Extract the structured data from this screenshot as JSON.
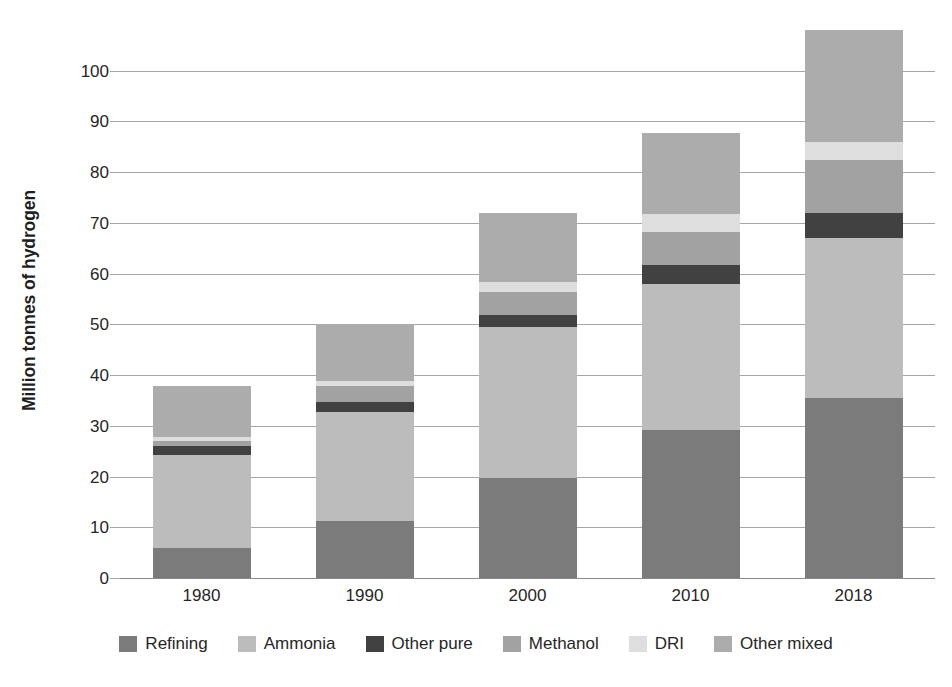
{
  "chart_data": {
    "type": "bar",
    "stacked": true,
    "title": "",
    "subtitle": "",
    "xlabel": "",
    "ylabel": "Million tonnes of hydrogen",
    "categories": [
      "1980",
      "1990",
      "2000",
      "2010",
      "2018"
    ],
    "ylim": [
      0,
      110
    ],
    "yticks": [
      0,
      10,
      20,
      30,
      40,
      50,
      60,
      70,
      80,
      90,
      100
    ],
    "ytick_labels": [
      "0",
      "10",
      "20",
      "30",
      "40",
      "50",
      "60",
      "70",
      "80",
      "90",
      "100"
    ],
    "grid": true,
    "legend_position": "bottom",
    "series": [
      {
        "name": "Refining",
        "color": "#7b7b7b",
        "values": [
          6.0,
          11.3,
          19.8,
          29.2,
          35.5
        ]
      },
      {
        "name": "Ammonia",
        "color": "#bcbcbc",
        "values": [
          18.3,
          21.5,
          29.7,
          28.8,
          31.5
        ]
      },
      {
        "name": "Other pure",
        "color": "#414141",
        "values": [
          1.7,
          1.9,
          2.3,
          3.8,
          5.0
        ]
      },
      {
        "name": "Methanol",
        "color": "#a2a2a2",
        "values": [
          1.0,
          3.1,
          4.5,
          6.5,
          10.5
        ]
      },
      {
        "name": "DRI",
        "color": "#dedede",
        "values": [
          0.8,
          1.0,
          2.0,
          3.5,
          3.5
        ]
      },
      {
        "name": "Other mixed",
        "color": "#acacac",
        "values": [
          10.0,
          11.2,
          13.7,
          16.0,
          22.0
        ]
      }
    ],
    "totals": [
      37.8,
      50.0,
      72.0,
      87.8,
      108.0
    ],
    "legend_entries": [
      "Refining",
      "Ammonia",
      "Other pure",
      "Methanol",
      "DRI",
      "Other mixed"
    ]
  }
}
